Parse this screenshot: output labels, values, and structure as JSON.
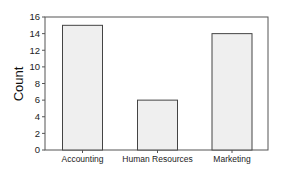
{
  "chart_data": {
    "type": "bar",
    "title": "",
    "xlabel": "",
    "ylabel": "Count",
    "categories": [
      "Accounting",
      "Human Resources",
      "Marketing"
    ],
    "values": [
      15,
      6,
      14
    ],
    "ylim": [
      0,
      16
    ],
    "yticks": [
      0,
      2,
      4,
      6,
      8,
      10,
      12,
      14,
      16
    ],
    "grid": false,
    "legend": null,
    "colors": {
      "bar_fill": "#efefef",
      "bar_stroke": "#444444",
      "frame": "#555555",
      "background": "#ffffff"
    }
  }
}
